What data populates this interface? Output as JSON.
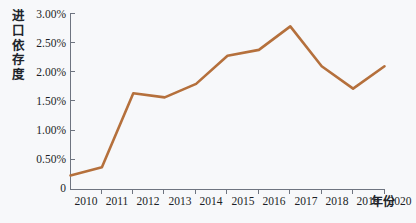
{
  "chart_data": {
    "type": "line",
    "title": "",
    "xlabel": "年份",
    "ylabel": "进口依存度",
    "ylabel_chars": [
      "进",
      "口",
      "依",
      "存",
      "度"
    ],
    "categories": [
      "2010",
      "2011",
      "2012",
      "2013",
      "2014",
      "2015",
      "2016",
      "2017",
      "2018",
      "2019",
      "2020"
    ],
    "x": [
      2010,
      2011,
      2012,
      2013,
      2014,
      2015,
      2016,
      2017,
      2018,
      2019,
      2020
    ],
    "values": [
      0.24,
      0.38,
      1.64,
      1.57,
      1.8,
      2.28,
      2.38,
      2.78,
      2.1,
      1.72,
      2.1
    ],
    "value_unit": "%",
    "ytick_labels": [
      "3.00%",
      "2.50%",
      "2.00%",
      "1.50%",
      "1.00%",
      "0.50%",
      "0"
    ],
    "ytick_values": [
      3.0,
      2.5,
      2.0,
      1.5,
      1.0,
      0.5,
      0
    ],
    "ylim": [
      0,
      3.0
    ],
    "xlim": [
      2010,
      2020
    ],
    "grid": false,
    "legend": "none",
    "series": [
      {
        "name": "进口依存度",
        "color": "#b5703c",
        "values": [
          0.24,
          0.38,
          1.64,
          1.57,
          1.8,
          2.28,
          2.38,
          2.78,
          2.1,
          1.72,
          2.1
        ]
      }
    ],
    "colors": {
      "line": "#b5703c",
      "axis": "#6e7480",
      "text": "#1c1f26",
      "background": "#f7f8fa"
    }
  }
}
